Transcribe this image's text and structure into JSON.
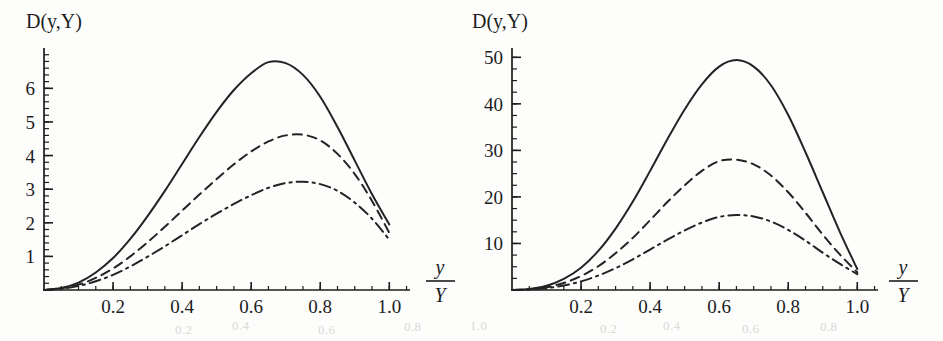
{
  "figure": {
    "background_color": "#fdfdfc",
    "ink_color": "#232323",
    "bleedthrough_fragments": [
      {
        "text": "0.2",
        "x": 175,
        "y": 322
      },
      {
        "text": "0.4",
        "x": 232,
        "y": 318
      },
      {
        "text": "0.6",
        "x": 318,
        "y": 322
      },
      {
        "text": "0.8",
        "x": 404,
        "y": 319
      },
      {
        "text": "1.0",
        "x": 470,
        "y": 318
      },
      {
        "text": "0.2",
        "x": 600,
        "y": 321
      },
      {
        "text": "0.4",
        "x": 663,
        "y": 318
      },
      {
        "text": "0.6",
        "x": 742,
        "y": 321
      },
      {
        "text": "0.8",
        "x": 820,
        "y": 319
      }
    ]
  },
  "panels": [
    {
      "id": "left",
      "name": "panel-left",
      "ylabel": "D(y,Y)",
      "xlabel_numerator": "y",
      "xlabel_denominator": "Y",
      "x_ticks": [
        "0.2",
        "0.4",
        "0.6",
        "0.8",
        "1.0"
      ],
      "y_ticks": [
        "1",
        "2",
        "3",
        "4",
        "5",
        "6"
      ]
    },
    {
      "id": "right",
      "name": "panel-right",
      "ylabel": "D(y,Y)",
      "xlabel_numerator": "y",
      "xlabel_denominator": "Y",
      "x_ticks": [
        "0.2",
        "0.4",
        "0.6",
        "0.8",
        "1.0"
      ],
      "y_ticks": [
        "10",
        "20",
        "30",
        "40",
        "50"
      ]
    }
  ],
  "chart_data": [
    {
      "type": "line",
      "panel": "left",
      "title": "",
      "xlabel": "y/Y",
      "ylabel": "D(y,Y)",
      "xlim": [
        0,
        1.06
      ],
      "ylim": [
        0,
        7.2
      ],
      "grid": false,
      "legend": "none",
      "x_ticks": [
        0.2,
        0.4,
        0.6,
        0.8,
        1.0
      ],
      "y_ticks": [
        1,
        2,
        3,
        4,
        5,
        6
      ],
      "x_minor_step": 0.05,
      "y_minor_step": 0.2,
      "x": [
        0.0,
        0.05,
        0.1,
        0.15,
        0.2,
        0.25,
        0.3,
        0.35,
        0.4,
        0.45,
        0.5,
        0.55,
        0.6,
        0.65,
        0.7,
        0.75,
        0.8,
        0.85,
        0.9,
        0.95,
        1.0
      ],
      "series": [
        {
          "name": "solid",
          "linestyle": "solid",
          "peak_x": 0.63,
          "peak_y": 6.8,
          "end_y": 1.95,
          "values": [
            0.0,
            0.06,
            0.22,
            0.52,
            0.95,
            1.52,
            2.2,
            2.95,
            3.75,
            4.55,
            5.3,
            5.95,
            6.45,
            6.78,
            6.75,
            6.4,
            5.75,
            4.85,
            3.85,
            2.85,
            1.95
          ]
        },
        {
          "name": "dashed",
          "linestyle": "dashed",
          "peak_x": 0.66,
          "peak_y": 4.65,
          "end_y": 1.7,
          "values": [
            0.0,
            0.05,
            0.16,
            0.36,
            0.64,
            1.0,
            1.42,
            1.88,
            2.36,
            2.84,
            3.3,
            3.74,
            4.12,
            4.42,
            4.6,
            4.62,
            4.45,
            4.05,
            3.45,
            2.65,
            1.7
          ]
        },
        {
          "name": "dash-dot",
          "linestyle": "dashdot",
          "peak_x": 0.68,
          "peak_y": 3.22,
          "end_y": 1.5,
          "values": [
            0.0,
            0.04,
            0.12,
            0.26,
            0.45,
            0.7,
            0.99,
            1.3,
            1.63,
            1.96,
            2.27,
            2.56,
            2.82,
            3.04,
            3.18,
            3.22,
            3.15,
            2.95,
            2.6,
            2.12,
            1.5
          ]
        }
      ]
    },
    {
      "type": "line",
      "panel": "right",
      "title": "",
      "xlabel": "y/Y",
      "ylabel": "D(y,Y)",
      "xlim": [
        0,
        1.06
      ],
      "ylim": [
        0,
        52
      ],
      "grid": false,
      "legend": "none",
      "x_ticks": [
        0.2,
        0.4,
        0.6,
        0.8,
        1.0
      ],
      "y_ticks": [
        10,
        20,
        30,
        40,
        50
      ],
      "x_minor_step": 0.05,
      "y_minor_step": 2.5,
      "x": [
        0.0,
        0.05,
        0.1,
        0.15,
        0.2,
        0.25,
        0.3,
        0.35,
        0.4,
        0.45,
        0.5,
        0.55,
        0.6,
        0.65,
        0.7,
        0.75,
        0.8,
        0.85,
        0.9,
        0.95,
        1.0
      ],
      "series": [
        {
          "name": "solid",
          "linestyle": "solid",
          "peak_x": 0.59,
          "peak_y": 49.5,
          "end_y": 4.5,
          "values": [
            0.0,
            0.2,
            0.9,
            2.4,
            4.8,
            8.4,
            13.2,
            19.0,
            25.6,
            32.4,
            38.8,
            44.2,
            48.0,
            49.4,
            48.0,
            44.0,
            37.6,
            29.6,
            21.0,
            12.4,
            4.5
          ]
        },
        {
          "name": "dashed",
          "linestyle": "dashed",
          "peak_x": 0.6,
          "peak_y": 28.0,
          "end_y": 3.8,
          "values": [
            0.0,
            0.15,
            0.6,
            1.5,
            3.0,
            5.1,
            7.9,
            11.2,
            15.0,
            18.9,
            22.5,
            25.6,
            27.7,
            28.0,
            27.0,
            24.6,
            21.0,
            16.6,
            11.9,
            7.6,
            3.8
          ]
        },
        {
          "name": "dash-dot",
          "linestyle": "dashdot",
          "peak_x": 0.62,
          "peak_y": 16.1,
          "end_y": 3.4,
          "values": [
            0.0,
            0.1,
            0.4,
            0.95,
            1.85,
            3.1,
            4.7,
            6.6,
            8.7,
            10.8,
            12.8,
            14.5,
            15.7,
            16.1,
            15.8,
            14.7,
            12.9,
            10.6,
            8.0,
            5.6,
            3.4
          ]
        }
      ]
    }
  ]
}
